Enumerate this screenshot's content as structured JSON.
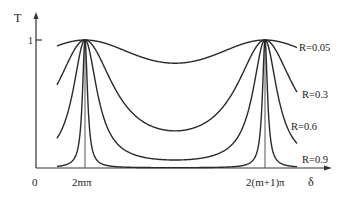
{
  "chart_data": {
    "type": "line",
    "title": "",
    "xlabel": "δ",
    "ylabel": "T",
    "x_ticks": [
      {
        "label": "0",
        "value": 0
      },
      {
        "label": "2mπ",
        "value": "2mπ"
      },
      {
        "label": "2(m+1)π",
        "value": "2(m+1)π"
      }
    ],
    "y_ticks": [
      {
        "label": "1",
        "value": 1
      }
    ],
    "ylim": [
      0,
      1
    ],
    "grid": false,
    "legend_position": "right (inline labels at curve ends)",
    "series": [
      {
        "name": "R=0.05",
        "R": 0.05,
        "T_max": 1,
        "T_min": 0.82
      },
      {
        "name": "R=0.3",
        "R": 0.3,
        "T_max": 1,
        "T_min": 0.29
      },
      {
        "name": "R=0.6",
        "R": 0.6,
        "T_max": 1,
        "T_min": 0.06
      },
      {
        "name": "R=0.9",
        "R": 0.9,
        "T_max": 1,
        "T_min": 0.003
      }
    ],
    "formula": "T = 1 / (1 + F sin^2(δ/2)), F = 4R/(1-R)^2"
  },
  "labels": {
    "y_axis": "T",
    "x_axis": "δ",
    "origin": "0",
    "y_tick_one": "1",
    "peak1": "2mπ",
    "peak2": "2(m+1)π",
    "r1": "R=0.05",
    "r2": "R=0.3",
    "r3": "R=0.6",
    "r4": "R=0.9"
  }
}
